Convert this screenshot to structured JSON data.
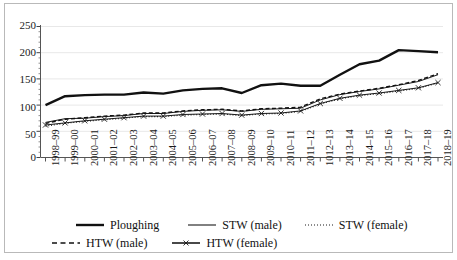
{
  "chart_data": {
    "type": "line",
    "title": "",
    "xlabel": "",
    "ylabel": "",
    "ylim": [
      0,
      250
    ],
    "ytick_values": [
      0,
      50,
      100,
      150,
      200,
      250
    ],
    "ytick_labels": [
      "0",
      "50",
      "100",
      "150",
      "200",
      "250"
    ],
    "y_minor_ticks": true,
    "grid": "horizontal",
    "legend_position": "below",
    "categories": [
      "1998–99",
      "1999–00",
      "2000–01",
      "2001–02",
      "2002–03",
      "2003–04",
      "2004–05",
      "2005–06",
      "2006–07",
      "2007–08",
      "2008–09",
      "2009–10",
      "2010–11",
      "2011–12",
      "1012–13",
      "2013–14",
      "2014–15",
      "2015–16",
      "2016–17",
      "2017–18",
      "2018–19"
    ],
    "series": [
      {
        "name": "Ploughing",
        "style": "solid-thick",
        "marker": "none",
        "color": "#111111",
        "values": [
          100,
          117,
          119,
          120,
          120,
          124,
          122,
          128,
          131,
          132,
          123,
          138,
          141,
          137,
          137,
          158,
          178,
          185,
          205,
          203,
          201
        ]
      },
      {
        "name": "STW (male)",
        "style": "solid-thin",
        "marker": "none",
        "color": "#1a1a1a",
        "values": [
          67,
          74,
          75,
          78,
          80,
          84,
          84,
          88,
          90,
          91,
          88,
          92,
          93,
          94,
          110,
          120,
          126,
          131,
          138,
          145,
          158
        ]
      },
      {
        "name": "STW (female)",
        "style": "dotted",
        "marker": "none",
        "color": "#1a1a1a",
        "values": [
          60,
          65,
          69,
          72,
          75,
          78,
          78,
          81,
          82,
          83,
          80,
          83,
          84,
          88,
          102,
          112,
          118,
          122,
          127,
          132,
          142
        ]
      },
      {
        "name": "HTW (male)",
        "style": "dashed",
        "marker": "none",
        "color": "#111111",
        "values": [
          65,
          73,
          76,
          79,
          81,
          85,
          85,
          89,
          91,
          92,
          89,
          93,
          94,
          96,
          112,
          121,
          127,
          132,
          139,
          147,
          160
        ]
      },
      {
        "name": "HTW (female)",
        "style": "solid-thin-marker",
        "marker": "x",
        "color": "#1a1a1a",
        "values": [
          62,
          66,
          70,
          73,
          76,
          79,
          79,
          82,
          83,
          84,
          81,
          84,
          85,
          89,
          103,
          113,
          119,
          123,
          128,
          133,
          143
        ]
      }
    ]
  }
}
